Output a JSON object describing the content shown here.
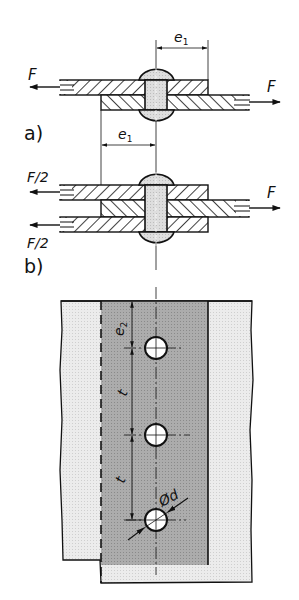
{
  "diagram": {
    "type": "riveted joint technical drawing",
    "views": [
      {
        "id": "a",
        "label": "a)",
        "description": "Single-shear lap joint",
        "force_left": "F",
        "force_right": "F",
        "dimension_label": "e1",
        "dimension_label_main": "e",
        "dimension_label_sub": "1"
      },
      {
        "id": "b",
        "label": "b)",
        "description": "Double-shear butt joint",
        "force_left_top": "F/2",
        "force_left_bottom": "F/2",
        "force_right": "F",
        "dimension_label": "e1",
        "dimension_label_main": "e",
        "dimension_label_sub": "1"
      }
    ],
    "plan_view": {
      "description": "Top view of strap with rivet holes",
      "edge_distance_label": "e2",
      "edge_distance_main": "e",
      "edge_distance_sub": "2",
      "pitch_label_1": "t",
      "pitch_label_2": "t",
      "diameter_label": "Ød",
      "hole_count": 3
    },
    "colors": {
      "line": "#111111",
      "plate_light": "#e6e6e6",
      "plate_dark": "#a9a9a9",
      "rivet_fill": "#dcdcdc",
      "background": "#ffffff"
    }
  }
}
